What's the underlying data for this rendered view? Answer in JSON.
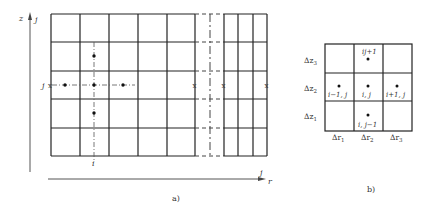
{
  "figure_a": {
    "caption": "a)",
    "z_axis_label": "z",
    "z_axis_sublabel": "j",
    "r_axis_label": "r",
    "r_axis_sublabel": "j",
    "row_marker_label": "j",
    "column_marker_label": "i",
    "grid": {
      "x_lines_left": [
        51,
        80,
        109,
        138,
        167,
        195
      ],
      "x_break_dash": 210,
      "x_lines_right": [
        224,
        238,
        253,
        267
      ],
      "y_lines": [
        14,
        42,
        71,
        99,
        128,
        156
      ]
    },
    "nodes": [
      {
        "x": 65,
        "y": 85
      },
      {
        "x": 94,
        "y": 85
      },
      {
        "x": 123,
        "y": 85
      },
      {
        "x": 94,
        "y": 56
      },
      {
        "x": 94,
        "y": 113
      }
    ],
    "boundary_marks": [
      {
        "x": 195,
        "y": 85,
        "glyph": "x"
      },
      {
        "x": 224,
        "y": 85,
        "glyph": "x"
      },
      {
        "x": 267,
        "y": 85,
        "glyph": "x"
      }
    ]
  },
  "figure_b": {
    "caption": "b)",
    "row_labels": [
      "Δz3",
      "Δz2",
      "Δz1"
    ],
    "row_labels_main": [
      "Δz",
      "Δz",
      "Δz"
    ],
    "row_labels_sub": [
      "3",
      "2",
      "1"
    ],
    "col_labels_main": [
      "Δr",
      "Δr",
      "Δr"
    ],
    "col_labels_sub": [
      "1",
      "2",
      "3"
    ],
    "node_labels": {
      "top": "i,j+1",
      "top_display": "ij+1",
      "left": "i−1, j",
      "center": "i, j",
      "right": "i+1, j",
      "bottom": "i, j−1"
    }
  }
}
